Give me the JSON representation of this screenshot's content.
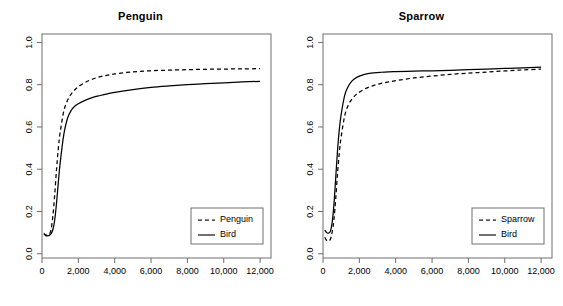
{
  "chart_data": [
    {
      "type": "line",
      "title": "Penguin",
      "xlabel": "",
      "ylabel": "",
      "xlim": [
        0,
        12600
      ],
      "ylim": [
        -0.02,
        1.04
      ],
      "grid": false,
      "legend_position": "bottom-right",
      "xticks": [
        0,
        2000,
        4000,
        6000,
        8000,
        10000,
        12000
      ],
      "xtick_labels": [
        "0",
        "2,000",
        "4,000",
        "6,000",
        "8,000",
        "10,000",
        "12,000"
      ],
      "yticks": [
        0.0,
        0.2,
        0.4,
        0.6,
        0.8,
        1.0
      ],
      "ytick_labels": [
        "0.0",
        "0.2",
        "0.4",
        "0.6",
        "0.8",
        "1.0"
      ],
      "series": [
        {
          "name": "Penguin",
          "style": "dashed",
          "color": "#000000",
          "x": [
            100,
            200,
            300,
            400,
            500,
            600,
            700,
            800,
            900,
            1000,
            1200,
            1400,
            1600,
            1800,
            2000,
            2400,
            2800,
            3200,
            3600,
            4000,
            5000,
            6000,
            7000,
            8000,
            9000,
            10000,
            11000,
            12000
          ],
          "y": [
            0.097,
            0.09,
            0.088,
            0.092,
            0.115,
            0.18,
            0.28,
            0.4,
            0.5,
            0.575,
            0.675,
            0.725,
            0.755,
            0.775,
            0.79,
            0.812,
            0.827,
            0.838,
            0.845,
            0.851,
            0.861,
            0.866,
            0.869,
            0.871,
            0.873,
            0.874,
            0.875,
            0.876
          ]
        },
        {
          "name": "Bird",
          "style": "solid",
          "color": "#000000",
          "x": [
            100,
            200,
            300,
            400,
            500,
            600,
            700,
            800,
            900,
            1000,
            1200,
            1400,
            1600,
            1800,
            2000,
            2400,
            2800,
            3200,
            3600,
            4000,
            5000,
            6000,
            7000,
            8000,
            9000,
            10000,
            11000,
            12000
          ],
          "y": [
            0.093,
            0.086,
            0.085,
            0.087,
            0.095,
            0.115,
            0.16,
            0.24,
            0.34,
            0.43,
            0.565,
            0.64,
            0.678,
            0.698,
            0.71,
            0.727,
            0.74,
            0.749,
            0.757,
            0.764,
            0.777,
            0.787,
            0.794,
            0.8,
            0.805,
            0.809,
            0.813,
            0.816
          ]
        }
      ]
    },
    {
      "type": "line",
      "title": "Sparrow",
      "xlabel": "",
      "ylabel": "",
      "xlim": [
        0,
        12600
      ],
      "ylim": [
        -0.02,
        1.04
      ],
      "grid": false,
      "legend_position": "bottom-right",
      "xticks": [
        0,
        2000,
        4000,
        6000,
        8000,
        10000,
        12000
      ],
      "xtick_labels": [
        "0",
        "2,000",
        "4,000",
        "6,000",
        "8,000",
        "10,000",
        "12,000"
      ],
      "yticks": [
        0.0,
        0.2,
        0.4,
        0.6,
        0.8,
        1.0
      ],
      "ytick_labels": [
        "0.0",
        "0.2",
        "0.4",
        "0.6",
        "0.8",
        "1.0"
      ],
      "series": [
        {
          "name": "Sparrow",
          "style": "dashed",
          "color": "#000000",
          "x": [
            100,
            200,
            300,
            400,
            500,
            600,
            700,
            800,
            900,
            1000,
            1200,
            1400,
            1600,
            1800,
            2000,
            2400,
            2800,
            3200,
            3600,
            4000,
            5000,
            6000,
            7000,
            8000,
            9000,
            10000,
            11000,
            12000
          ],
          "y": [
            0.078,
            0.063,
            0.06,
            0.068,
            0.1,
            0.16,
            0.26,
            0.38,
            0.48,
            0.555,
            0.655,
            0.705,
            0.733,
            0.752,
            0.765,
            0.784,
            0.797,
            0.806,
            0.813,
            0.819,
            0.832,
            0.841,
            0.849,
            0.855,
            0.86,
            0.865,
            0.87,
            0.874
          ]
        },
        {
          "name": "Bird",
          "style": "solid",
          "color": "#000000",
          "x": [
            100,
            200,
            300,
            400,
            500,
            600,
            700,
            800,
            900,
            1000,
            1200,
            1400,
            1600,
            1800,
            2000,
            2400,
            2800,
            3200,
            3600,
            4000,
            5000,
            6000,
            7000,
            8000,
            9000,
            10000,
            11000,
            12000
          ],
          "y": [
            0.112,
            0.1,
            0.098,
            0.105,
            0.145,
            0.23,
            0.36,
            0.49,
            0.59,
            0.66,
            0.752,
            0.794,
            0.818,
            0.832,
            0.841,
            0.851,
            0.856,
            0.859,
            0.861,
            0.862,
            0.864,
            0.866,
            0.868,
            0.871,
            0.874,
            0.877,
            0.88,
            0.883
          ]
        }
      ]
    }
  ],
  "panels": [
    {
      "id": "penguin",
      "title": "Penguin",
      "legend": {
        "entries": [
          {
            "label": "Penguin",
            "style": "dashed"
          },
          {
            "label": "Bird",
            "style": "solid"
          }
        ]
      }
    },
    {
      "id": "sparrow",
      "title": "Sparrow",
      "legend": {
        "entries": [
          {
            "label": "Sparrow",
            "style": "dashed"
          },
          {
            "label": "Bird",
            "style": "solid"
          }
        ]
      }
    }
  ],
  "colors": {
    "axis": "#6e6e6e",
    "line": "#1a1a1a",
    "background": "#ffffff",
    "text": "#000000"
  }
}
